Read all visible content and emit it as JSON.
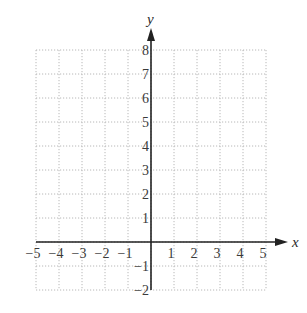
{
  "chart_data": {
    "type": "scatter",
    "title": "",
    "xlabel": "x",
    "ylabel": "y",
    "xlim": [
      -5,
      5
    ],
    "ylim": [
      -2,
      8
    ],
    "grid": true,
    "grid_style": "dotted",
    "x_ticks": [
      -5,
      -4,
      -3,
      -2,
      -1,
      1,
      2,
      3,
      4,
      5
    ],
    "y_ticks": [
      -2,
      -1,
      1,
      2,
      3,
      4,
      5,
      6,
      7,
      8
    ],
    "x_tick_labels": [
      "−5",
      "−4",
      "−3",
      "−2",
      "−1",
      "1",
      "2",
      "3",
      "4",
      "5"
    ],
    "y_tick_labels": [
      "−2",
      "−1",
      "1",
      "2",
      "3",
      "4",
      "5",
      "6",
      "7",
      "8"
    ],
    "series": [],
    "legend": null
  },
  "colors": {
    "axis": "#222222",
    "grid": "#b8b8b8",
    "text": "#3a3a3a"
  }
}
